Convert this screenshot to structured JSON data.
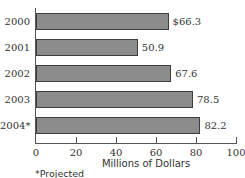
{
  "chart_data": {
    "type": "bar",
    "orientation": "horizontal",
    "title": "",
    "categories": [
      "2000",
      "2001",
      "2002",
      "2003",
      "2004*"
    ],
    "values": [
      66.3,
      50.9,
      67.6,
      78.5,
      82.2
    ],
    "value_labels": [
      "$66.3",
      "50.9",
      "67.6",
      "78.5",
      "82.2"
    ],
    "xlabel": "Millions of Dollars",
    "ylabel": "",
    "xlim": [
      0,
      100
    ],
    "xticks": [
      0,
      20,
      40,
      60,
      80,
      100
    ],
    "grid": false,
    "legend": null,
    "footnote": "*Projected",
    "colors": {
      "bar_fill": "#8c8c8c",
      "bar_border": "#3e3e3e",
      "axis": "#555555"
    }
  }
}
